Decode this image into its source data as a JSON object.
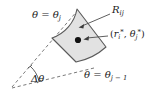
{
  "figure": {
    "background_color": "#ffffff",
    "region_fill_color": "#e2e2e2",
    "stroke_color": "#4d4d4d",
    "text_color": "#1a1a1a",
    "labels": {
      "upper_left_ray": "θ = θ",
      "upper_left_ray_sub": "j",
      "region": "R",
      "region_sub": "ij",
      "sample_point_open": "(",
      "sample_point_r": "r",
      "sample_point_r_sub": "i",
      "sample_point_r_sup": "*",
      "sample_point_sep": ", ",
      "sample_point_theta": "θ",
      "sample_point_theta_sub": "j",
      "sample_point_theta_sup": "*",
      "sample_point_close": ")",
      "lower_right_ray": "θ = θ",
      "lower_right_ray_sub": "j − 1",
      "delta_theta": "Δθ"
    },
    "geometry": {
      "origin_x": 11,
      "origin_y": 88,
      "region_vertices": {
        "top": [
          77,
          9
        ],
        "left": [
          52,
          38
        ],
        "bottom_left": [
          76,
          62
        ],
        "right": [
          106,
          47
        ]
      },
      "sample_dot": [
        78,
        40
      ],
      "dot_radius": 3.1
    },
    "annotations": {
      "region_arrow_from": [
        110,
        14
      ],
      "region_arrow_to": [
        79,
        27
      ],
      "point_arrow_from": [
        107,
        36
      ],
      "point_arrow_to": [
        84,
        39
      ]
    }
  }
}
